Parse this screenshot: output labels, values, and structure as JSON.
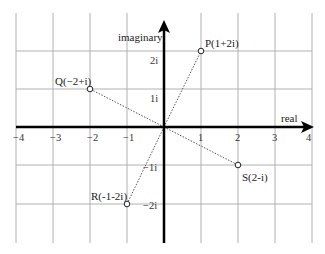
{
  "diagram": {
    "axes": {
      "x_label": "real",
      "y_label": "imaginary",
      "x_ticks": [
        "−4",
        "−3",
        "−2",
        "−1",
        "1",
        "2",
        "3",
        "4"
      ],
      "y_ticks": [
        "2i",
        "1i",
        "−1i",
        "−2i"
      ]
    },
    "points": [
      {
        "name": "P",
        "label": "P(1+2i)",
        "re": 1,
        "im": 2
      },
      {
        "name": "Q",
        "label": "Q(−2+i)",
        "re": -2,
        "im": 1
      },
      {
        "name": "R",
        "label": "R(-1-2i)",
        "re": -1,
        "im": -2
      },
      {
        "name": "S",
        "label": "S(2-i)",
        "re": 2,
        "im": -1
      }
    ],
    "colors": {
      "grid": "#a8a8a8",
      "axis": "#000000",
      "dotted_line": "#555555",
      "point_fill": "#ffffff",
      "point_stroke": "#222222"
    }
  }
}
